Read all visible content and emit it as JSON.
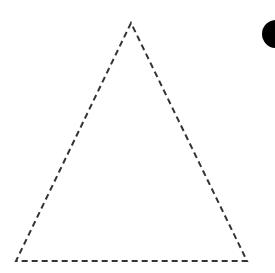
{
  "diagram": {
    "triangle": {
      "apex": [
        131,
        23
      ],
      "base_left": [
        16,
        261
      ],
      "base_right": [
        247,
        261
      ],
      "stroke": "#333333",
      "style": "dashed"
    },
    "dot": {
      "center": [
        276,
        34
      ],
      "radius": 14,
      "fill": "#000000"
    }
  }
}
